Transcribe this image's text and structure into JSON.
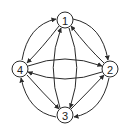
{
  "diagram": {
    "type": "directed-graph",
    "colors": {
      "stroke": "#2a2a2a",
      "node_fill": "#ffffff",
      "label": "#222222",
      "background": "#ffffff"
    },
    "nodes": [
      {
        "id": "1",
        "label": "1",
        "cx": 65,
        "cy": 20
      },
      {
        "id": "2",
        "label": "2",
        "cx": 110,
        "cy": 69
      },
      {
        "id": "3",
        "label": "3",
        "cx": 65,
        "cy": 115
      },
      {
        "id": "4",
        "label": "4",
        "cx": 20,
        "cy": 69
      }
    ],
    "node_radius": 8,
    "edges": [
      {
        "from": "4",
        "to": "1",
        "path": "M 22 60 Q 28 25 56 19"
      },
      {
        "from": "1",
        "to": "4",
        "path": "M 59 26 Q 42 48 27 63"
      },
      {
        "from": "1",
        "to": "2",
        "path": "M 73 19 Q 102 25 108 60"
      },
      {
        "from": "2",
        "to": "1",
        "path": "M 104 63 Q 88 48 71 26"
      },
      {
        "from": "3",
        "to": "4",
        "path": "M 56 117 Q 28 112 21 78"
      },
      {
        "from": "4",
        "to": "3",
        "path": "M 27 75 Q 42 92 59 109"
      },
      {
        "from": "2",
        "to": "3",
        "path": "M 109 78 Q 102 112 74 117"
      },
      {
        "from": "3",
        "to": "2",
        "path": "M 71 109 Q 88 92 104 75"
      },
      {
        "from": "3",
        "to": "1",
        "path": "M 60 108 Q 46 67 61 28"
      },
      {
        "from": "1",
        "to": "3",
        "path": "M 69 28 Q 84 67 70 108"
      },
      {
        "from": "4",
        "to": "2",
        "path": "M 28 66 Q 65 52 102 66"
      },
      {
        "from": "2",
        "to": "4",
        "path": "M 102 72 Q 65 86 28 72"
      }
    ]
  }
}
